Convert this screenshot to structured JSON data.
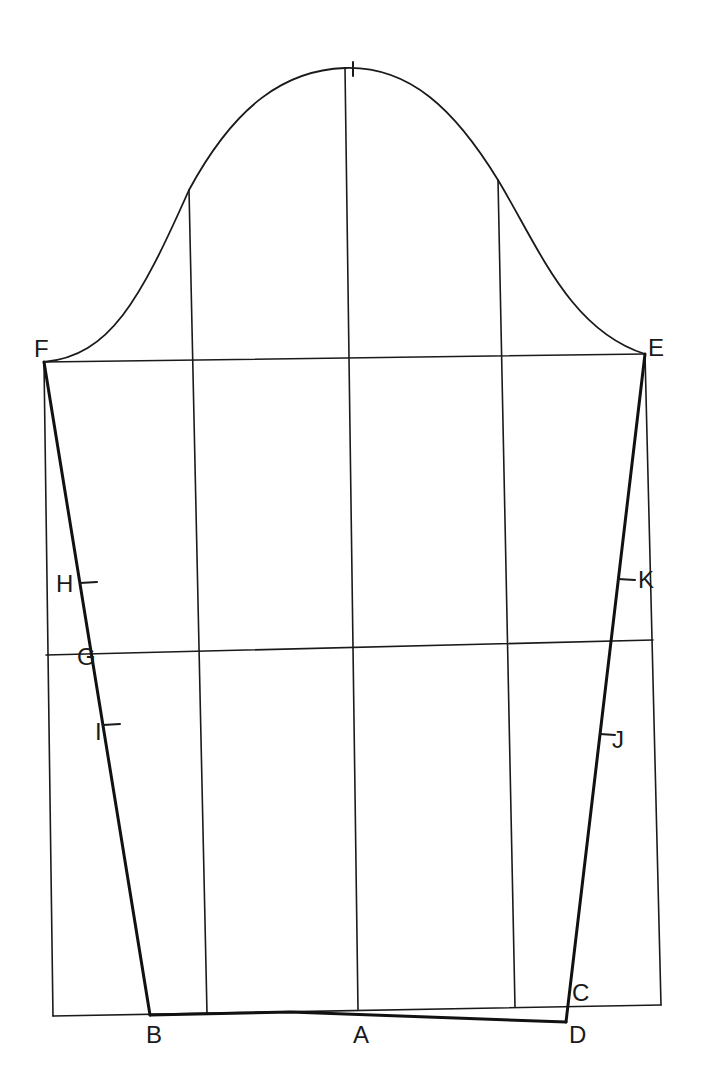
{
  "diagram": {
    "title": "",
    "type": "sleeve pattern draft",
    "colors": {
      "line": "#1a1a1a",
      "background": "#ffffff"
    },
    "points": {
      "A": {
        "label": "A",
        "x": 362,
        "y": 1043
      },
      "B": {
        "label": "B",
        "x": 155,
        "y": 1043
      },
      "C": {
        "label": "C",
        "x": 581,
        "y": 1001
      },
      "D": {
        "label": "D",
        "x": 578,
        "y": 1042
      },
      "E": {
        "label": "E",
        "x": 655,
        "y": 355
      },
      "F": {
        "label": "F",
        "x": 34,
        "y": 357
      },
      "G": {
        "label": "G",
        "x": 87,
        "y": 664
      },
      "H": {
        "label": "H",
        "x": 64,
        "y": 591
      },
      "I": {
        "label": "I",
        "x": 97,
        "y": 738
      },
      "J": {
        "label": "J",
        "x": 617,
        "y": 746
      },
      "K": {
        "label": "K",
        "x": 646,
        "y": 587
      }
    },
    "marks": [
      "cap-top-tick",
      "H-tick",
      "I-tick",
      "J-tick",
      "K-tick"
    ]
  }
}
